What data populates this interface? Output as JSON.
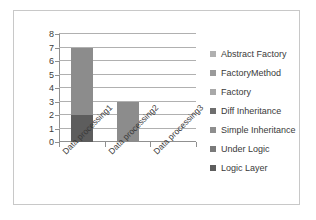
{
  "chart_data": {
    "type": "bar",
    "subtype": "stacked-column",
    "title": "",
    "xlabel": "",
    "ylabel": "",
    "categories": [
      "Data processing1",
      "Data processing2",
      "Data processing3"
    ],
    "ylim": [
      0,
      8
    ],
    "yticks": [
      0,
      1,
      2,
      3,
      4,
      5,
      6,
      7,
      8
    ],
    "ytick_labels": [
      "0",
      "1",
      "2",
      "3",
      "4",
      "5",
      "6",
      "7",
      "8"
    ],
    "grid": true,
    "grid_axis": "y",
    "legend_position": "right",
    "series": [
      {
        "name": "Abstract Factory",
        "color": "#b0b0b0",
        "values": [
          0,
          0,
          0
        ]
      },
      {
        "name": "FactoryMethod",
        "color": "#9a9a9a",
        "values": [
          0,
          0,
          0
        ]
      },
      {
        "name": "Factory",
        "color": "#a8a8a8",
        "values": [
          0,
          0,
          0
        ]
      },
      {
        "name": "Diff Inheritance",
        "color": "#6e6e6e",
        "values": [
          0,
          0,
          0
        ]
      },
      {
        "name": "Simple Inheritance",
        "color": "#8e8e8e",
        "values": [
          0,
          0,
          0
        ]
      },
      {
        "name": "Under Logic",
        "color": "#7a7a7a",
        "values": [
          5,
          3,
          0
        ]
      },
      {
        "name": "Logic Layer",
        "color": "#5d5d5d",
        "values": [
          2,
          0,
          0
        ]
      }
    ],
    "stacked_totals": [
      7,
      3,
      0
    ],
    "bar_segments": [
      {
        "category": "Data processing1",
        "segments": [
          {
            "series": "Logic Layer",
            "from": 0,
            "to": 2,
            "color": "#5d5d5d"
          },
          {
            "series": "Under Logic",
            "from": 2,
            "to": 7,
            "color": "#8c8c8c"
          }
        ]
      },
      {
        "category": "Data processing2",
        "segments": [
          {
            "series": "Under Logic",
            "from": 0,
            "to": 3,
            "color": "#8c8c8c"
          }
        ]
      },
      {
        "category": "Data processing3",
        "segments": []
      }
    ]
  },
  "legend": {
    "items": [
      {
        "label": "Abstract Factory",
        "color": "#b0b0b0"
      },
      {
        "label": "FactoryMethod",
        "color": "#9a9a9a"
      },
      {
        "label": "Factory",
        "color": "#a8a8a8"
      },
      {
        "label": "Diff Inheritance",
        "color": "#6e6e6e"
      },
      {
        "label": "Simple Inheritance",
        "color": "#8e8e8e"
      },
      {
        "label": "Under Logic",
        "color": "#7a7a7a"
      },
      {
        "label": "Logic Layer",
        "color": "#5d5d5d"
      }
    ]
  },
  "colors": {
    "frame_border": "#c8c8c8",
    "gridline": "#b0b0b0",
    "axis": "#909090",
    "text": "#3a3a3a",
    "background": "#ffffff"
  }
}
